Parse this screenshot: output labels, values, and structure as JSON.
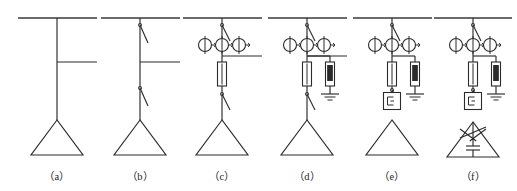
{
  "figure": {
    "background_color": "#ffffff",
    "line_color": "#2b2b2b",
    "bus_color": "#3a3a3a",
    "width": 517,
    "height": 191
  },
  "captions": [
    {
      "id": "a",
      "label": "（a）",
      "x": 57,
      "y": 168
    },
    {
      "id": "b",
      "label": "（b）",
      "x": 140,
      "y": 168
    },
    {
      "id": "c",
      "label": "（c）",
      "x": 222,
      "y": 168
    },
    {
      "id": "d",
      "label": "（d）",
      "x": 307,
      "y": 168
    },
    {
      "id": "e",
      "label": "（e）",
      "x": 392,
      "y": 168
    },
    {
      "id": "f",
      "label": "（f）",
      "x": 473,
      "y": 168
    }
  ],
  "diagrams": [
    {
      "id": "a",
      "name": "scheme-a",
      "axis_x": 57,
      "bus": {
        "x1": 18,
        "x2": 97,
        "y": 18
      },
      "riser": {
        "x": 57,
        "y1": 18,
        "y2": 120
      },
      "tap": {
        "x1": 57,
        "x2": 97,
        "y": 62
      },
      "components": [],
      "transformer": {
        "apex_x": 57,
        "apex_y": 120,
        "half_width": 26,
        "base_y": 155
      }
    },
    {
      "id": "b",
      "name": "scheme-b",
      "axis_x": 140,
      "bus": {
        "x1": 101,
        "x2": 180,
        "y": 18
      },
      "riser": {
        "x": 140,
        "y1": 18,
        "y2": 120
      },
      "tap": {
        "x1": 140,
        "x2": 180,
        "y": 62
      },
      "components": [
        {
          "type": "disconnector",
          "name": "upper-disconnect-switch",
          "y": 25,
          "length": 18
        },
        {
          "type": "disconnector",
          "name": "lower-disconnect-switch",
          "y": 88,
          "length": 18
        }
      ],
      "transformer": {
        "apex_x": 140,
        "apex_y": 120,
        "half_width": 26,
        "base_y": 155
      }
    },
    {
      "id": "c",
      "name": "scheme-c",
      "axis_x": 222,
      "bus": {
        "x1": 183,
        "x2": 262,
        "y": 18
      },
      "riser": {
        "x": 222,
        "y1": 18,
        "y2": 120
      },
      "tap": {
        "x1": 222,
        "x2": 262,
        "y": 56
      },
      "components": [
        {
          "type": "disconnector",
          "name": "upper-disconnect-switch",
          "y": 25,
          "length": 16
        },
        {
          "type": "ct-bank",
          "name": "current-transformer-bank",
          "y": 45,
          "radius": 6.5,
          "spacing": 17,
          "count": 3
        },
        {
          "type": "fuse",
          "name": "fuse",
          "y": 62,
          "w": 9,
          "h": 24
        },
        {
          "type": "disconnector",
          "name": "lower-disconnect-switch",
          "y": 94,
          "length": 16
        }
      ],
      "transformer": {
        "apex_x": 222,
        "apex_y": 120,
        "half_width": 26,
        "base_y": 155
      }
    },
    {
      "id": "d",
      "name": "scheme-d",
      "axis_x": 307,
      "bus": {
        "x1": 268,
        "x2": 347,
        "y": 18
      },
      "riser": {
        "x": 307,
        "y1": 18,
        "y2": 120
      },
      "tap": {
        "x1": 307,
        "x2": 347,
        "y": 56
      },
      "components": [
        {
          "type": "disconnector",
          "name": "upper-disconnect-switch",
          "y": 25,
          "length": 16
        },
        {
          "type": "ct-bank",
          "name": "current-transformer-bank",
          "y": 45,
          "radius": 6.5,
          "spacing": 17,
          "count": 3
        },
        {
          "type": "fuse",
          "name": "fuse",
          "y": 62,
          "w": 9,
          "h": 24
        },
        {
          "type": "arrester-branch",
          "name": "surge-arrester-branch",
          "branch_y": 56,
          "branch_x": 330,
          "arrester_y": 62,
          "w": 9,
          "h": 24,
          "ground_y": 94
        },
        {
          "type": "disconnector",
          "name": "lower-disconnect-switch",
          "y": 94,
          "length": 16
        }
      ],
      "transformer": {
        "apex_x": 307,
        "apex_y": 120,
        "half_width": 26,
        "base_y": 155
      }
    },
    {
      "id": "e",
      "name": "scheme-e",
      "axis_x": 392,
      "bus": {
        "x1": 353,
        "x2": 432,
        "y": 18
      },
      "riser": {
        "x": 392,
        "y1": 18,
        "y2": 101
      },
      "tap": null,
      "components": [
        {
          "type": "disconnector",
          "name": "upper-disconnect-switch",
          "y": 25,
          "length": 16
        },
        {
          "type": "ct-bank",
          "name": "current-transformer-bank",
          "y": 45,
          "radius": 6.5,
          "spacing": 17,
          "count": 3
        },
        {
          "type": "fuse",
          "name": "fuse",
          "y": 62,
          "w": 9,
          "h": 24
        },
        {
          "type": "arrester-branch",
          "name": "surge-arrester-branch",
          "branch_y": 56,
          "branch_x": 415,
          "arrester_y": 62,
          "w": 9,
          "h": 24,
          "ground_y": 94
        },
        {
          "type": "disconnector",
          "name": "lower-disconnect-switch",
          "y": 90,
          "length": 14
        },
        {
          "type": "relay-box",
          "name": "protection-relay-box",
          "y": 101,
          "size": 17
        }
      ],
      "transformer": {
        "apex_x": 392,
        "apex_y": 120,
        "half_width": 26,
        "base_y": 155
      }
    },
    {
      "id": "f",
      "name": "scheme-f",
      "axis_x": 473,
      "bus": {
        "x1": 434,
        "x2": 512,
        "y": 18
      },
      "riser": {
        "x": 473,
        "y1": 18,
        "y2": 101
      },
      "tap": null,
      "components": [
        {
          "type": "disconnector",
          "name": "upper-disconnect-switch",
          "y": 25,
          "length": 16
        },
        {
          "type": "ct-bank",
          "name": "current-transformer-bank",
          "y": 45,
          "radius": 6.5,
          "spacing": 17,
          "count": 3
        },
        {
          "type": "fuse",
          "name": "fuse",
          "y": 62,
          "w": 9,
          "h": 24
        },
        {
          "type": "arrester-branch",
          "name": "surge-arrester-branch",
          "branch_y": 56,
          "branch_x": 496,
          "arrester_y": 62,
          "w": 9,
          "h": 24,
          "ground_y": 94
        },
        {
          "type": "disconnector",
          "name": "lower-disconnect-switch",
          "y": 90,
          "length": 14
        },
        {
          "type": "relay-box",
          "name": "protection-relay-box",
          "y": 101,
          "size": 17
        }
      ],
      "transformer": {
        "apex_x": 473,
        "apex_y": 122,
        "half_width": 26,
        "base_y": 157,
        "variant": "delta-with-capacitor",
        "star_half": 13,
        "capacitor": {
          "y": 146,
          "plate_half": 7,
          "gap": 4
        }
      }
    }
  ],
  "legend_meaning": {
    "bus": "incoming high-voltage bus",
    "disconnector": "disconnect switch (isolator)",
    "ct-bank": "three current transformers / metering set",
    "fuse": "high-voltage fuse",
    "arrester": "surge arrester with earth connection",
    "relay-box": "protection / control unit",
    "transformer": "delta-connected transformer winding",
    "capacitor": "shunt capacitor bank"
  }
}
